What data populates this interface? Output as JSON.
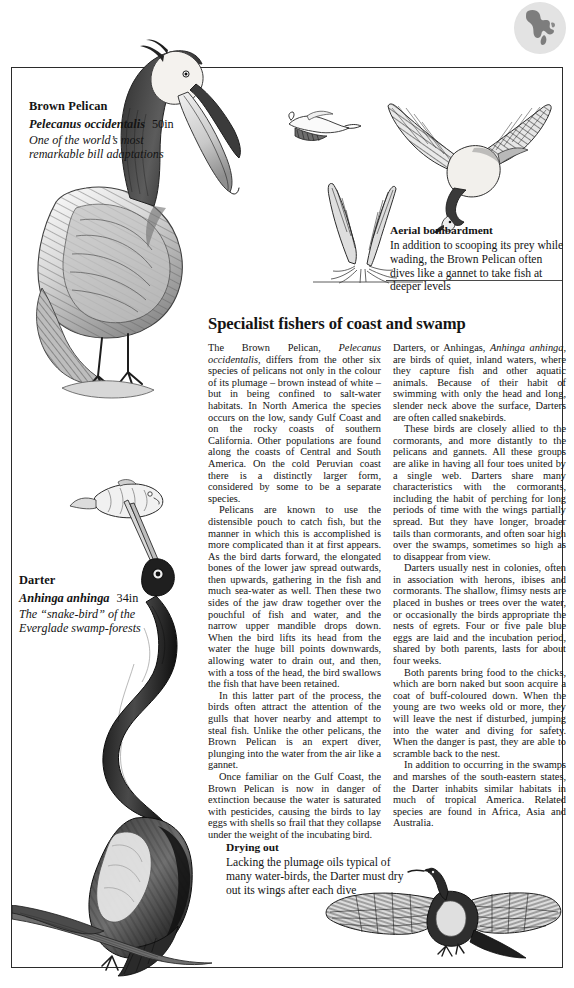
{
  "page": {
    "region_icon": "north-america-map-globe"
  },
  "pelican": {
    "common_name": "Brown Pelican",
    "scientific_name": "Pelecanus occidentalis",
    "size": "50in",
    "tagline_line1": "One of the world’s most",
    "tagline_line2": "remarkable bill adaptations"
  },
  "darter": {
    "common_name": "Darter",
    "scientific_name": "Anhinga anhinga",
    "size": "34in",
    "tagline_line1": "The “snake-bird” of the",
    "tagline_line2": "Everglade swamp-forests"
  },
  "captions": {
    "aerial": {
      "title": "Aerial bombardment",
      "body": "In addition to scooping its prey while wading, the Brown Pelican often dives like a gannet to take fish  at deeper levels"
    },
    "drying": {
      "title": "Drying out",
      "body": "Lacking the plumage oils typical of many water-birds, the Darter must dry out its wings after each dive"
    }
  },
  "article": {
    "title": "Specialist fishers of coast and swamp",
    "left_column": [
      "The Brown Pelican, <i>Pelecanus occidentalis</i>, differs from the other six species of pelicans not only in the colour of its plumage – brown instead of white – but in being confined to salt-water habitats. In North America the species occurs on the low, sandy Gulf Coast and on the rocky coasts of southern California. Other populations are found along the coasts of Central and South America. On the cold Peruvian coast there is a distinctly larger form, considered by some to be a separate species.",
      "Pelicans are known to use the distensible pouch to catch fish, but the manner in which this is accomplished is more complicated than it at first appears. As the bird darts forward, the elongated bones of the lower jaw spread outwards, then upwards, gathering in the fish and much sea-water as well. Then these two sides of the jaw draw together over the pouchful of fish and water, and the narrow upper mandible drops down. When the bird lifts its head from the water the huge bill points downwards, allowing water to drain out, and then, with a toss of the head, the bird swallows the fish that have been retained.",
      "In this latter part of the process, the birds often attract the attention of the gulls that hover nearby and attempt to steal fish. Unlike the other pelicans, the Brown Pelican is an expert diver, plunging into the water from the air like a gannet.",
      "Once familiar on the Gulf Coast, the Brown Pelican is now in danger of extinction because the water is saturated with pesticides, causing the birds to lay eggs with shells so frail that they collapse under the weight of the incubating bird."
    ],
    "right_column": [
      "Darters, or Anhingas, <i>Anhinga anhinga</i>, are birds of quiet, inland waters, where they capture fish and other aquatic animals. Because of their habit of swimming with only the head and long, slender neck above the surface, Darters are often called snakebirds.",
      "These birds are closely allied to the cormorants, and more distantly to the pelicans and gannets. All these groups are alike in having all four toes united by a single web. Darters share many characteristics with the cormorants, including the habit of perching for long periods of time with the wings partially spread. But they have longer, broader tails than cormorants, and often soar high over the swamps, sometimes so high as to disappear from view.",
      "Darters usually nest in colonies, often in association with herons, ibises and cormorants. The shallow, flimsy nests are placed in bushes or trees over the water, or occasionally the birds appropriate the nests of egrets. Four or five pale blue eggs are laid and the incubation period, shared by both parents, lasts for about four weeks.",
      "Both parents bring food to the chicks, which are born naked but soon acquire a coat of buff-coloured down. When the young are two weeks old or more, they will leave the nest if disturbed, jumping into the water and diving for safety. When the danger is past, they are able to scramble back to the nest.",
      "In addition to occurring in the swamps and marshes of the south-eastern states, the Darter inhabits similar habitats in much of tropical America. Related species are found in Africa, Asia and Australia."
    ]
  },
  "illustrations": [
    {
      "name": "brown-pelican-standing-illustration"
    },
    {
      "name": "pelican-flying-illustration"
    },
    {
      "name": "pelican-diving-illustration"
    },
    {
      "name": "pelican-plunge-splash-illustration"
    },
    {
      "name": "darter-with-speared-fish-illustration"
    },
    {
      "name": "darter-wings-spread-drying-illustration"
    }
  ],
  "colors": {
    "ink": "#1d1d1d",
    "frame": "#2b2b2b",
    "globe_bg": "#e2e2e2",
    "paper": "#ffffff"
  }
}
